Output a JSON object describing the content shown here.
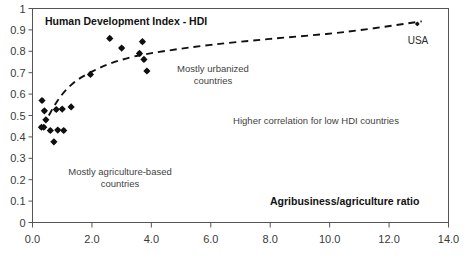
{
  "figure": {
    "width": 468,
    "height": 259,
    "background": "#ffffff",
    "frame_color": "#555555",
    "marker_color": "#101010",
    "trend_color": "#111111"
  },
  "chart_data": {
    "type": "scatter",
    "title": "Human Development Index - HDI",
    "xlabel": "Agribusiness/agriculture ratio",
    "ylabel": "",
    "xlim": [
      0.0,
      14.0
    ],
    "ylim": [
      0,
      1
    ],
    "xticks": [
      "0.0",
      "2.0",
      "4.0",
      "6.0",
      "8.0",
      "10.0",
      "12.0",
      "14.0"
    ],
    "xtick_values": [
      0.0,
      2.0,
      4.0,
      6.0,
      8.0,
      10.0,
      12.0,
      14.0
    ],
    "yticks": [
      "0",
      "0.1",
      "0.2",
      "0.3",
      "0.4",
      "0.5",
      "0.6",
      "0.7",
      "0.8",
      "0.9",
      "1"
    ],
    "ytick_values": [
      0,
      0.1,
      0.2,
      0.3,
      0.4,
      0.5,
      0.6,
      0.7,
      0.8,
      0.9,
      1.0
    ],
    "grid": false,
    "legend": null,
    "points": [
      {
        "x": 0.3,
        "y": 0.445
      },
      {
        "x": 0.32,
        "y": 0.57
      },
      {
        "x": 0.38,
        "y": 0.445
      },
      {
        "x": 0.4,
        "y": 0.522
      },
      {
        "x": 0.45,
        "y": 0.48
      },
      {
        "x": 0.6,
        "y": 0.43
      },
      {
        "x": 0.72,
        "y": 0.377
      },
      {
        "x": 0.8,
        "y": 0.528
      },
      {
        "x": 0.85,
        "y": 0.432
      },
      {
        "x": 1.0,
        "y": 0.53
      },
      {
        "x": 1.05,
        "y": 0.43
      },
      {
        "x": 1.3,
        "y": 0.54
      },
      {
        "x": 1.95,
        "y": 0.692
      },
      {
        "x": 2.6,
        "y": 0.86
      },
      {
        "x": 3.0,
        "y": 0.815
      },
      {
        "x": 3.7,
        "y": 0.845
      },
      {
        "x": 3.6,
        "y": 0.79
      },
      {
        "x": 3.75,
        "y": 0.762
      },
      {
        "x": 3.85,
        "y": 0.708
      },
      {
        "x": 12.95,
        "y": 0.928
      }
    ],
    "trend": {
      "style": "dashed",
      "description": "logarithmic fit rising steeply then flattening",
      "vertices": [
        {
          "x": 0.55,
          "y": 0.5
        },
        {
          "x": 0.8,
          "y": 0.56
        },
        {
          "x": 1.1,
          "y": 0.615
        },
        {
          "x": 1.5,
          "y": 0.665
        },
        {
          "x": 2.0,
          "y": 0.705
        },
        {
          "x": 2.6,
          "y": 0.742
        },
        {
          "x": 3.4,
          "y": 0.775
        },
        {
          "x": 4.4,
          "y": 0.8
        },
        {
          "x": 6.0,
          "y": 0.83
        },
        {
          "x": 8.0,
          "y": 0.858
        },
        {
          "x": 10.5,
          "y": 0.89
        },
        {
          "x": 13.1,
          "y": 0.94
        }
      ]
    },
    "point_labels": [
      {
        "text": "USA",
        "x": 12.95,
        "y": 0.928
      }
    ],
    "annotations": [
      {
        "id": "urbanized",
        "lines": [
          "Mostly urbanized",
          "countries"
        ],
        "x": 6.05,
        "y": 0.705
      },
      {
        "id": "agriculture",
        "lines": [
          "Mostly agriculture-based",
          "countries"
        ],
        "x": 2.95,
        "y": 0.215
      },
      {
        "id": "correlation",
        "lines": [
          "Higher correlation for low HDI countries"
        ],
        "x": 9.55,
        "y": 0.475
      }
    ]
  },
  "labels": {
    "title": "Human Development Index - HDI",
    "x_axis_title": "Agribusiness/agriculture ratio",
    "usa_label": "USA",
    "annot_urbanized_line1": "Mostly urbanized",
    "annot_urbanized_line2": "countries",
    "annot_agriculture_line1": "Mostly agriculture-based",
    "annot_agriculture_line2": "countries",
    "annot_correlation": "Higher correlation for low HDI countries"
  },
  "xtick_labels": {
    "t0": "0.0",
    "t1": "2.0",
    "t2": "4.0",
    "t3": "6.0",
    "t4": "8.0",
    "t5": "10.0",
    "t6": "12.0",
    "t7": "14.0"
  },
  "ytick_labels": {
    "t0": "0",
    "t1": "0.1",
    "t2": "0.2",
    "t3": "0.3",
    "t4": "0.4",
    "t5": "0.5",
    "t6": "0.6",
    "t7": "0.7",
    "t8": "0.8",
    "t9": "0.9",
    "t10": "1"
  }
}
